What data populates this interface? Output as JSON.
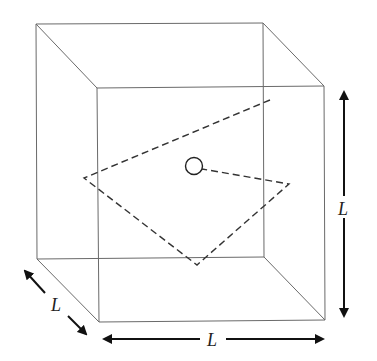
{
  "diagram": {
    "title": "",
    "shape": "cube",
    "colors": {
      "edges": "#6a6a6a",
      "dashed_path": "#333333",
      "arrows": "#111111",
      "labels": "#222222"
    },
    "labels": {
      "height": "L",
      "width": "L",
      "depth": "L"
    },
    "elements": {
      "particle": "circle marker",
      "path": "dashed trajectory bouncing inside the box"
    }
  }
}
